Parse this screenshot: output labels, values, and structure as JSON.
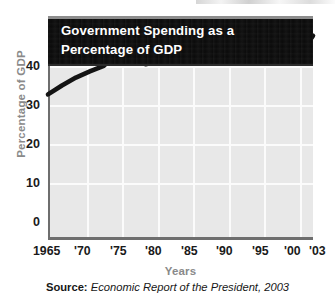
{
  "figure": {
    "title": "Government Spending as a\nPercentage of GDP",
    "source_label": "Source:",
    "source_text": "Economic Report of the President, 2003"
  },
  "colors": {
    "banner_background": "#0a0a0a",
    "banner_text": "#ffffff",
    "plot_background": "#e8e8e8",
    "gridline": "#fbfbfb",
    "axis": "#6e6e6e",
    "data_line": "#141414",
    "axis_title": "#8a8a8a",
    "tick_label": "#1a1a1a",
    "page_background": "#ffffff"
  },
  "chart_data": {
    "type": "line",
    "title": "Government Spending as a Percentage of GDP",
    "xlabel": "Years",
    "ylabel": "Percentage of GDP",
    "xlim": [
      1965,
      2003
    ],
    "ylim": [
      0,
      40
    ],
    "yticks": [
      0,
      10,
      20,
      30,
      40
    ],
    "ytick_labels": [
      "0",
      "10",
      "20",
      "30",
      "40"
    ],
    "xticks": [
      1965,
      1970,
      1975,
      1980,
      1985,
      1990,
      1995,
      2000,
      2003
    ],
    "xtick_labels": [
      "1965",
      "'70",
      "'75",
      "'80",
      "'85",
      "'90",
      "'95",
      "'00",
      "'03"
    ],
    "grid": true,
    "legend": "none",
    "series": [
      {
        "name": "Government Spending as a Percentage of GDP",
        "color": "#141414",
        "x": [
          1965,
          1967,
          1969,
          1971,
          1973,
          1975,
          1977,
          1979,
          1981,
          1983,
          1985,
          1987,
          1989,
          1991,
          1993,
          1995,
          1997,
          1999,
          2001,
          2003
        ],
        "values": [
          26.0,
          27.6,
          29.0,
          30.1,
          31.1,
          33.5,
          32.7,
          31.4,
          32.0,
          32.7,
          32.8,
          32.7,
          32.6,
          33.2,
          32.8,
          32.7,
          33.1,
          32.8,
          32.8,
          36.5
        ]
      }
    ]
  },
  "axis_geometry": {
    "plot_left_px": 48,
    "plot_top_px": 16,
    "plot_width_px": 265,
    "plot_height_px": 224,
    "y_gridlines_px": [
      50,
      89,
      128,
      167
    ],
    "x_gridlines_px": [
      37,
      72,
      108,
      143,
      179,
      214,
      250,
      285
    ]
  }
}
